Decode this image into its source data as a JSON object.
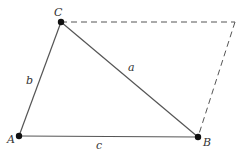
{
  "diagram": {
    "type": "triangle-with-parallelogram-construction",
    "colors": {
      "line": "#555555",
      "point": "#111111",
      "label": "#333333",
      "background": "#ffffff"
    },
    "points": [
      {
        "id": "A",
        "label": "A",
        "x": 19,
        "y": 136,
        "label_x": 7,
        "label_y": 143
      },
      {
        "id": "B",
        "label": "B",
        "x": 198,
        "y": 137,
        "label_x": 203,
        "label_y": 146
      },
      {
        "id": "C",
        "label": "C",
        "x": 61,
        "y": 22,
        "label_x": 54,
        "label_y": 16
      }
    ],
    "sides": [
      {
        "id": "a",
        "label": "a",
        "from": "C",
        "to": "B",
        "label_x": 128,
        "label_y": 71
      },
      {
        "id": "b",
        "label": "b",
        "from": "A",
        "to": "C",
        "label_x": 26,
        "label_y": 84
      },
      {
        "id": "c",
        "label": "c",
        "from": "A",
        "to": "B",
        "label_x": 96,
        "label_y": 149
      }
    ],
    "dashed_construction": {
      "corner": {
        "x": 235,
        "y": 22
      },
      "segments": [
        [
          "C",
          "corner"
        ],
        [
          "corner",
          "B"
        ]
      ]
    }
  }
}
